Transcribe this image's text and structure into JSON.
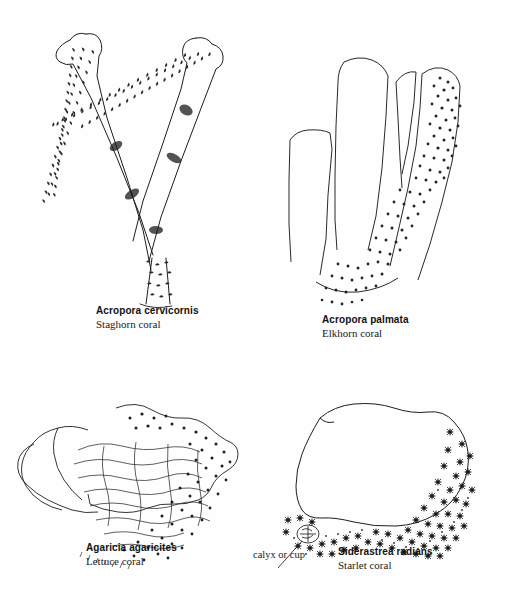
{
  "figure": {
    "background_color": "#fefefe",
    "ink_color": "#1a1a1a",
    "panels": [
      {
        "id": "staghorn",
        "icon": "coral-branching-icon",
        "scientific_name": "Acropora cervicornis",
        "common_name": "Staghorn coral",
        "growth_form": "branching antler-like",
        "texture": "scaly protruding corallites"
      },
      {
        "id": "elkhorn",
        "icon": "coral-plate-icon",
        "scientific_name": "Acropora palmata",
        "common_name": "Elkhorn coral",
        "growth_form": "broad flattened blades",
        "texture": "stippled shading on right lobe"
      },
      {
        "id": "lettuce",
        "icon": "coral-foliose-icon",
        "scientific_name": "Agaricia agaricites",
        "common_name": "Lettuce coral",
        "growth_form": "folded undulating plates",
        "texture": "sinuous ridges with small calyces"
      },
      {
        "id": "starlet",
        "icon": "coral-massive-icon",
        "scientific_name": "Siderastrea radians",
        "common_name": "Starlet coral",
        "growth_form": "rounded massive boulder",
        "texture": "star-shaped radiating calyces"
      }
    ],
    "annotations": [
      {
        "id": "calyx-callout",
        "text": "calyx or cup",
        "points_to": "starlet",
        "leader": "diagonal line to circled calyx on lower-left margin"
      }
    ]
  }
}
